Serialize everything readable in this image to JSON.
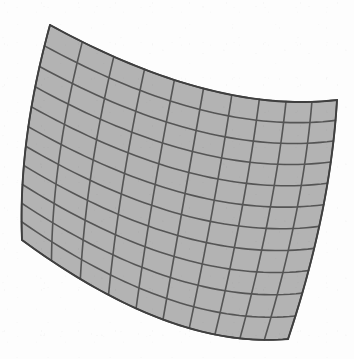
{
  "figure": {
    "name": "warped-quadrilateral-mesh",
    "title": "Distorted grid mesh",
    "canvas": {
      "width": 354,
      "height": 359
    },
    "grid_columns": 10,
    "grid_rows": 11
  },
  "colors": {
    "background": "#fdfdfd",
    "cell_fill": "#b3b3b3",
    "grid_line": "#555555",
    "outline": "#3f3f3f"
  },
  "style": {
    "grid_line_width": 1.6,
    "outline_width": 1.9,
    "fill_opacity": 1
  },
  "chart_data": {
    "type": "mesh",
    "title": "Distorted grid mesh",
    "columns": 10,
    "rows": 11,
    "corners": {
      "top_left": [
        50,
        25
      ],
      "top_right": [
        337,
        100
      ],
      "bottom_right": [
        288,
        339
      ],
      "bottom_left": [
        22,
        240
      ]
    },
    "edge_curvature": {
      "top": {
        "sag_x": 10,
        "sag_y": 26
      },
      "bottom": {
        "sag_x": 8,
        "sag_y": 30
      },
      "left": {
        "sag_x": -9,
        "sag_y": 4
      },
      "right": {
        "sag_x": 9,
        "sag_y": -4
      }
    },
    "interior_bulge": {
      "u": 0.0,
      "v": 0.0,
      "amount": 6
    }
  }
}
